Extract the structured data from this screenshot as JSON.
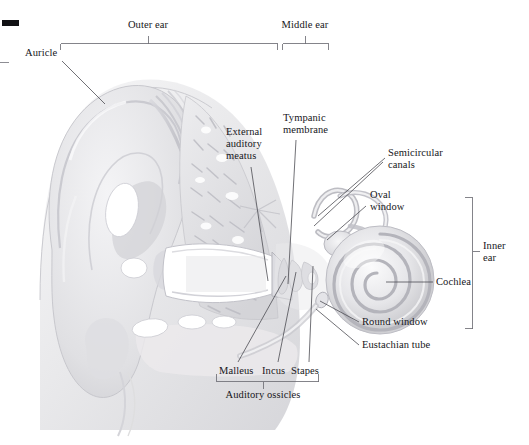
{
  "figure": {
    "background_color": "#ffffff",
    "line_color": "#6f6f76",
    "text_color": "#16161a",
    "width": 529,
    "height": 445
  },
  "region_brackets": [
    {
      "id": "outer-ear",
      "label": "Outer ear",
      "orientation": "horizontal",
      "label_x": 148,
      "label_y": 20,
      "span_start": 60,
      "span_end": 277,
      "axis": 43,
      "tick": 148
    },
    {
      "id": "middle-ear",
      "label": "Middle ear",
      "orientation": "horizontal",
      "label_x": 305,
      "label_y": 20,
      "span_start": 282,
      "span_end": 329,
      "axis": 43,
      "tick": 305
    },
    {
      "id": "inner-ear",
      "label": "Inner\near",
      "label_line_1": "Inner",
      "label_line_2": "ear",
      "orientation": "vertical",
      "label_x": 481,
      "label_y": 245,
      "span_start": 197,
      "span_end": 329,
      "axis": 472,
      "tick": 251
    },
    {
      "id": "auditory-ossicles",
      "label": "Auditory ossicles",
      "orientation": "horizontal-down",
      "label_x": 263,
      "label_y": 386,
      "span_start": 216,
      "span_end": 318,
      "axis": 381,
      "tick": 263
    }
  ],
  "structure_labels": [
    {
      "id": "auricle",
      "text": "Auricle",
      "x": 25,
      "y": 48,
      "align": "left",
      "leader": [
        [
          62,
          61
        ],
        [
          105,
          104
        ]
      ]
    },
    {
      "id": "external-auditory-meatus",
      "text": "External\nauditory\nmeatus",
      "lines": [
        "External",
        "auditory",
        "meatus"
      ],
      "x": 226,
      "y": 128,
      "align": "left",
      "leader": [
        [
          251,
          167
        ],
        [
          268,
          281
        ]
      ]
    },
    {
      "id": "tympanic-membrane",
      "text": "Tympanic\nmembrane",
      "lines": [
        "Tympanic",
        "membrane"
      ],
      "x": 283,
      "y": 113,
      "align": "left",
      "leader": [
        [
          296,
          140
        ],
        [
          290,
          283
        ]
      ]
    },
    {
      "id": "semicircular-canals",
      "text": "Semicircular\ncanals",
      "lines": [
        "Semicircular",
        "canals"
      ],
      "x": 388,
      "y": 148,
      "align": "left",
      "leader": [
        [
          385,
          158
        ],
        [
          318,
          216
        ]
      ]
    },
    {
      "id": "oval-window",
      "text": "Oval\nwindow",
      "lines": [
        "Oval",
        "window"
      ],
      "x": 370,
      "y": 190,
      "align": "left",
      "leader": [
        [
          367,
          205
        ],
        [
          327,
          238
        ]
      ]
    },
    {
      "id": "cochlea",
      "text": "Cochlea",
      "x": 436,
      "y": 277,
      "align": "left",
      "leader": [
        [
          433,
          282
        ],
        [
          385,
          282
        ]
      ]
    },
    {
      "id": "round-window",
      "text": "Round window",
      "x": 362,
      "y": 317,
      "align": "left",
      "leader": [
        [
          359,
          322
        ],
        [
          320,
          300
        ]
      ]
    },
    {
      "id": "eustachian-tube",
      "text": "Eustachian tube",
      "x": 362,
      "y": 340,
      "align": "left",
      "leader": [
        [
          359,
          345
        ],
        [
          318,
          310
        ]
      ]
    },
    {
      "id": "malleus",
      "text": "Malleus",
      "x": 219,
      "y": 366,
      "align": "left",
      "leader": [
        [
          237,
          364
        ],
        [
          285,
          275
        ]
      ]
    },
    {
      "id": "incus",
      "text": "Incus",
      "x": 262,
      "y": 366,
      "align": "left",
      "leader": [
        [
          277,
          364
        ],
        [
          295,
          271
        ]
      ]
    },
    {
      "id": "stapes",
      "text": "Stapes",
      "x": 291,
      "y": 366,
      "align": "left",
      "leader": [
        [
          308,
          364
        ],
        [
          312,
          266
        ]
      ]
    }
  ],
  "illustration": {
    "description": "Grayscale medical illustration: frontal section of the human ear showing auricle, external auditory meatus, tympanic membrane, ossicles, cochlea and semicircular canals.",
    "palette": {
      "cartilage_light": "#f2f2f3",
      "cartilage_mid": "#e2e2e4",
      "cartilage_shadow": "#cfcfd3",
      "bone_spongy": "#dcdcdf",
      "canal_void": "#ffffff",
      "outline": "#b8b8bd",
      "deep_shadow": "#a9a9af",
      "muscle_stripe": "#c9c9ce"
    }
  }
}
